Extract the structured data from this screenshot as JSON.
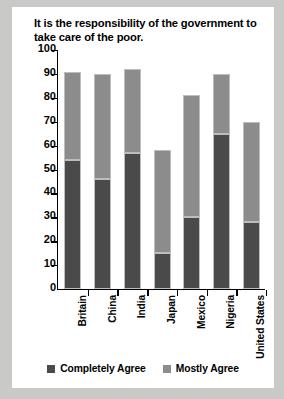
{
  "chart_data": {
    "type": "bar",
    "subtype": "stacked-vertical",
    "title": "It is the responsibility of the government to take care of the poor.",
    "xlabel": "",
    "ylabel": "",
    "ylim": [
      0,
      100
    ],
    "yticks": [
      0,
      10,
      20,
      30,
      40,
      50,
      60,
      70,
      80,
      90,
      100
    ],
    "ytick_labels": [
      "0",
      "10",
      "20",
      "30",
      "40",
      "50",
      "60",
      "70",
      "80",
      "90",
      "100"
    ],
    "grid": false,
    "legend_position": "bottom-center",
    "categories": [
      "Britain",
      "China",
      "India",
      "Japan",
      "Mexico",
      "Nigeria",
      "United States"
    ],
    "series": [
      {
        "name": "Completely Agree",
        "color": "#4a4a4a",
        "values": [
          54,
          46,
          57,
          15,
          30,
          65,
          28
        ]
      },
      {
        "name": "Mostly Agree",
        "color": "#8c8c8c",
        "values": [
          37,
          44,
          35,
          43,
          51,
          25,
          42
        ]
      }
    ],
    "totals": [
      91,
      90,
      92,
      58,
      81,
      90,
      70
    ]
  },
  "colors": {
    "page_background": "#c9c9c7",
    "figure_background": "#ffffff",
    "axis": "#000000",
    "text": "#000000",
    "completely_agree": "#4a4a4a",
    "mostly_agree": "#8c8c8c"
  }
}
